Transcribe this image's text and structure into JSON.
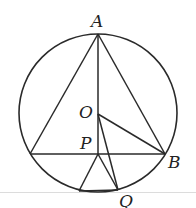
{
  "diagram": {
    "circle": {
      "cx": 98,
      "cy": 113,
      "r": 79
    },
    "points": {
      "A": {
        "x": 98,
        "y": 34,
        "label": "A",
        "lx": 91,
        "ly": 27
      },
      "O": {
        "x": 98,
        "y": 114,
        "label": "O",
        "lx": 79,
        "ly": 118
      },
      "P": {
        "x": 98,
        "y": 154,
        "label": "P",
        "lx": 80,
        "ly": 149
      },
      "B": {
        "x": 165,
        "y": 154,
        "label": "B",
        "lx": 168,
        "ly": 168
      },
      "C": {
        "x": 30,
        "y": 154,
        "label": ""
      },
      "Q": {
        "x": 118,
        "y": 190,
        "label": "Q",
        "lx": 119,
        "ly": 207
      },
      "D": {
        "x": 79,
        "y": 191,
        "label": ""
      }
    },
    "segments": [
      [
        "A",
        "C"
      ],
      [
        "A",
        "B"
      ],
      [
        "A",
        "P"
      ],
      [
        "C",
        "B"
      ],
      [
        "O",
        "B"
      ],
      [
        "O",
        "Q"
      ],
      [
        "P",
        "Q"
      ],
      [
        "P",
        "D"
      ],
      [
        "D",
        "Q"
      ]
    ],
    "stroke_color": "#2a2a2a",
    "baseline_color": "#d8d8d8"
  }
}
